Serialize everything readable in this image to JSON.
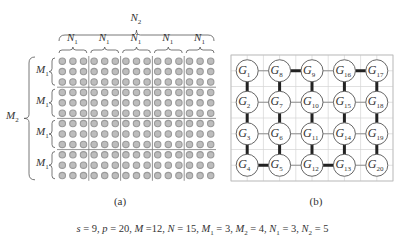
{
  "panel_a": {
    "caption": "(a)",
    "top_label": {
      "base": "N",
      "sub": "2"
    },
    "col_group_label": {
      "base": "N",
      "sub": "1"
    },
    "row_group_label": {
      "base": "M",
      "sub": "1"
    },
    "left_label": {
      "base": "M",
      "sub": "2"
    },
    "rows": 12,
    "cols": 15,
    "block_rows": 3,
    "block_cols": 3,
    "dot_color": "#9a9a9a"
  },
  "panel_b": {
    "caption": "(b)",
    "node_prefix": "G",
    "grid": [
      [
        "1",
        "8",
        "9",
        "16",
        "17"
      ],
      [
        "2",
        "7",
        "10",
        "15",
        "18"
      ],
      [
        "3",
        "6",
        "11",
        "14",
        "19"
      ],
      [
        "4",
        "5",
        "12",
        "13",
        "20"
      ]
    ],
    "thick_edges": [
      [
        "1",
        "2"
      ],
      [
        "2",
        "3"
      ],
      [
        "3",
        "4"
      ],
      [
        "4",
        "5"
      ],
      [
        "5",
        "6"
      ],
      [
        "6",
        "7"
      ],
      [
        "7",
        "8"
      ],
      [
        "8",
        "9"
      ],
      [
        "9",
        "10"
      ],
      [
        "10",
        "11"
      ],
      [
        "11",
        "12"
      ],
      [
        "12",
        "13"
      ],
      [
        "13",
        "14"
      ],
      [
        "14",
        "15"
      ],
      [
        "15",
        "16"
      ],
      [
        "16",
        "17"
      ],
      [
        "17",
        "18"
      ],
      [
        "18",
        "19"
      ],
      [
        "19",
        "20"
      ]
    ]
  },
  "caption": "s = 9, p = 20, M =12, N = 15, M₁ = 3, M₂ = 4, N₁ = 3, N₂ = 5",
  "caption_parts": {
    "s": "9",
    "p": "20",
    "M": "12",
    "N": "15",
    "M1": "3",
    "M2": "4",
    "N1": "3",
    "N2": "5"
  }
}
